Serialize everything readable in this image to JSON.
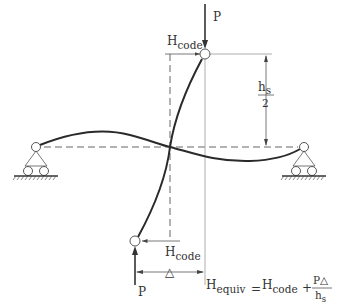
{
  "diagram": {
    "labels": {
      "top_load": "P",
      "bottom_load": "P",
      "top_force_main": "H",
      "top_force_sub": "code",
      "bottom_force_main": "H",
      "bottom_force_sub": "code",
      "half_height_num_main": "h",
      "half_height_num_sub": "s",
      "half_height_den": "2",
      "drift": "△",
      "formula_lhs_main": "H",
      "formula_lhs_sub": "equiv",
      "formula_eq": "=",
      "formula_rhs_main": "H",
      "formula_rhs_sub": "code",
      "formula_plus": "+",
      "formula_frac_num": "P△",
      "formula_frac_den_main": "h",
      "formula_frac_den_sub": "s"
    },
    "formula": "H_equiv = H_code + PΔ / h_s",
    "nodes": {
      "top_joint": [
        205,
        54
      ],
      "bottom_joint": [
        135,
        241
      ],
      "left_support": [
        36,
        147
      ],
      "right_support": [
        304,
        147
      ],
      "inflection_point": [
        170,
        147
      ]
    },
    "colors": {
      "line": "#2a2a2a",
      "dim": "#555555",
      "text": "#333333"
    }
  }
}
